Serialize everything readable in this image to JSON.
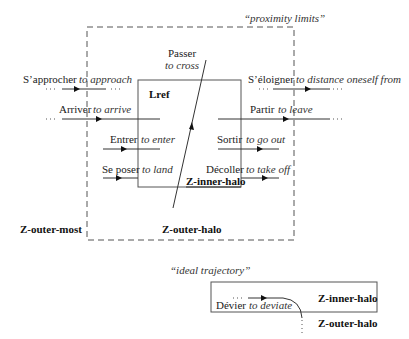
{
  "labels": {
    "proximity_limits": "“proximity limits”",
    "ideal_trajectory": "“ideal trajectory”",
    "lref": "Lref",
    "z_inner_halo": "Z-inner-halo",
    "z_outer_halo": "Z-outer-halo",
    "z_outer_most": "Z-outer-most",
    "bottom_inner_halo": "Z-inner-halo",
    "bottom_outer_halo": "Z-outer-halo"
  },
  "verbs": {
    "approach": {
      "fr": "S’approcher",
      "en": "to approach"
    },
    "arrive": {
      "fr": "Arriver",
      "en": "to arrive"
    },
    "enter": {
      "fr": "Entrer",
      "en": "to enter"
    },
    "land": {
      "fr": "Se poser",
      "en": "to land"
    },
    "cross": {
      "fr": "Passer",
      "en": "to cross"
    },
    "distance": {
      "fr": "S’éloigner",
      "en": "to distance oneself from"
    },
    "leave": {
      "fr": "Partir",
      "en": "to leave"
    },
    "go_out": {
      "fr": "Sortir",
      "en": "to go out"
    },
    "take_off": {
      "fr": "Décoller",
      "en": "to take off"
    },
    "deviate": {
      "fr": "Dévier",
      "en": "to deviate"
    }
  }
}
